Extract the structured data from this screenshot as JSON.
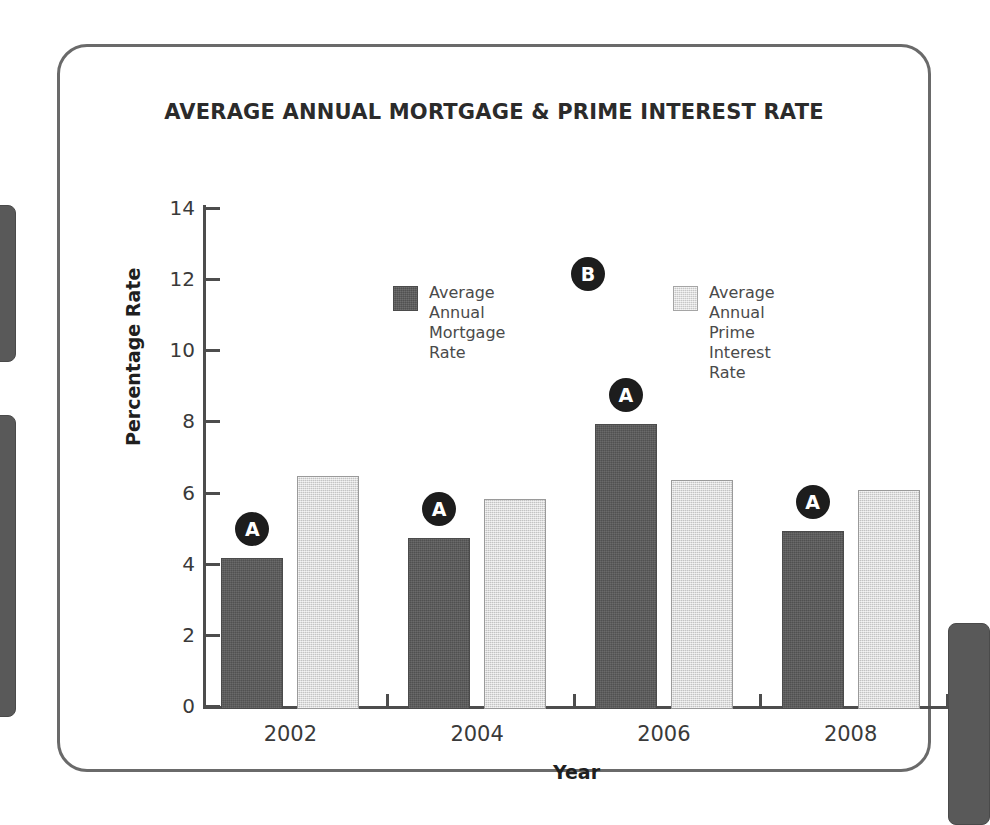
{
  "chart_data": {
    "type": "bar",
    "title": "AVERAGE ANNUAL MORTGAGE &  PRIME INTEREST RATE",
    "xlabel": "Year",
    "ylabel": "Percentage Rate",
    "categories": [
      "2002",
      "2004",
      "2006",
      "2008"
    ],
    "series": [
      {
        "name": "Average Annual\nMortgage Rate",
        "key": "mortgage",
        "color": "#595959",
        "values": [
          4.25,
          4.8,
          8.0,
          5.0
        ]
      },
      {
        "name": "Average Annual\nPrime Interest Rate",
        "key": "prime",
        "color": "#d9d9d9",
        "values": [
          6.55,
          5.9,
          6.45,
          6.15
        ]
      }
    ],
    "ylim": [
      0,
      14
    ],
    "ytick_labels": [
      "14",
      "12",
      "10",
      "8",
      "6",
      "4",
      "2",
      "0"
    ],
    "ytick_values": [
      14,
      12,
      10,
      8,
      6,
      4,
      2,
      0
    ],
    "grid": false,
    "legend_position": "inside-top-center"
  },
  "annotations": [
    {
      "label": "A",
      "target": "bar-2002-mortgage"
    },
    {
      "label": "A",
      "target": "bar-2004-mortgage"
    },
    {
      "label": "A",
      "target": "bar-2006-mortgage"
    },
    {
      "label": "A",
      "target": "bar-2008-mortgage"
    },
    {
      "label": "B",
      "target": "legend"
    }
  ]
}
